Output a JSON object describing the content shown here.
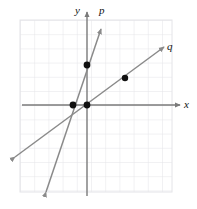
{
  "figure": {
    "kind": "coordinate-plane-with-two-lines",
    "labels": {
      "y_axis": "y",
      "x_axis": "x",
      "line_p": "p",
      "line_q": "q"
    },
    "colors": {
      "grid": "#e2e2e6",
      "axis": "#7a7a7a",
      "line": "#8a8a8a",
      "point": "#111111",
      "background": "#ffffff",
      "text": "#111111"
    },
    "geometry": {
      "origin_px": [
        87,
        105
      ],
      "unit_px": 14.2,
      "grid_x_px": [
        20,
        172
      ],
      "grid_y_px": [
        20,
        192
      ],
      "grid_columns": 11,
      "grid_rows": 12
    },
    "lines": [
      {
        "name": "p",
        "label": "p",
        "slope": 2,
        "y_intercept": 2,
        "x_intercept": -1,
        "arrows": "both",
        "endpoints_px": [
          [
            46,
            192
          ],
          [
            101,
            29
          ]
        ]
      },
      {
        "name": "q",
        "label": "q",
        "slope": 0.58,
        "y_intercept": 0,
        "x_intercept": 0,
        "arrows": "both",
        "endpoints_px": [
          [
            15,
            157
          ],
          [
            164,
            47
          ]
        ]
      }
    ],
    "points": [
      {
        "name": "point-on-p-y-intercept",
        "coords": [
          0,
          2
        ],
        "px": [
          87,
          65
        ]
      },
      {
        "name": "point-on-p-x-intercept",
        "coords": [
          -1,
          0
        ],
        "px": [
          73,
          105
        ]
      },
      {
        "name": "point-at-origin",
        "coords": [
          0,
          0
        ],
        "px": [
          87,
          105
        ]
      },
      {
        "name": "point-on-q",
        "coords": [
          2.7,
          1.6
        ],
        "px": [
          125,
          78
        ]
      }
    ]
  }
}
